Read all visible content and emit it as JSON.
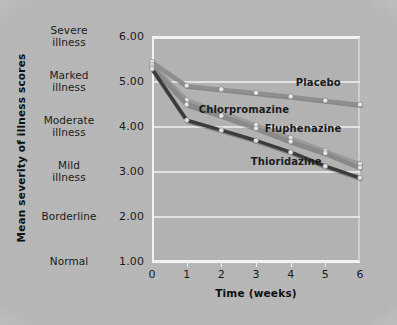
{
  "figure": {
    "background_color": "#b8b8b8",
    "panel_color": "#b2b2b2",
    "grid_color": "#f2f2f2",
    "text_color": "#1b1b1b"
  },
  "axes": {
    "y_title": "Mean severity of illness scores",
    "x_title": "Time (weeks)",
    "y_tick_numbers": [
      "6.00",
      "5.00",
      "4.00",
      "3.00",
      "2.00",
      "1.00"
    ],
    "y_tick_words": [
      [
        "Severe",
        "illness"
      ],
      [
        "Marked",
        "illness"
      ],
      [
        "Moderate",
        "illness"
      ],
      [
        "Mild",
        "illness"
      ],
      [
        "Borderline",
        ""
      ],
      [
        "Normal",
        ""
      ]
    ],
    "x_tick_numbers": [
      "0",
      "1",
      "2",
      "3",
      "4",
      "5",
      "6"
    ]
  },
  "chart_data": {
    "type": "line",
    "title": "",
    "xlabel": "Time (weeks)",
    "ylabel": "Mean severity of illness scores",
    "x": [
      0,
      1,
      2,
      3,
      4,
      5,
      6
    ],
    "xlim": [
      0,
      6
    ],
    "ylim": [
      1.0,
      6.0
    ],
    "y_tick_values": [
      6.0,
      5.0,
      4.0,
      3.0,
      2.0,
      1.0
    ],
    "y_tick_labels": [
      "Severe illness",
      "Marked illness",
      "Moderate illness",
      "Mild illness",
      "Borderline",
      "Normal"
    ],
    "grid": true,
    "grid_axis": "y",
    "legend": "inline-labels",
    "series": [
      {
        "name": "Placebo",
        "color": "#8f8f8f",
        "marker_color": "#e6e6e6",
        "values": [
          5.45,
          4.92,
          4.84,
          4.76,
          4.68,
          4.59,
          4.5
        ],
        "label_x_week": 4.15,
        "label_y_value": 4.97
      },
      {
        "name": "Chlorpromazine",
        "color": "#9a9a9a",
        "marker_color": "#e6e6e6",
        "values": [
          5.38,
          4.6,
          4.33,
          4.05,
          3.76,
          3.47,
          3.18
        ],
        "label_x_week": 1.35,
        "label_y_value": 4.38
      },
      {
        "name": "Fluphenazine",
        "color": "#8a8a8a",
        "marker_color": "#e6e6e6",
        "values": [
          5.33,
          4.5,
          4.25,
          3.97,
          3.68,
          3.42,
          3.1
        ],
        "label_x_week": 3.25,
        "label_y_value": 3.96
      },
      {
        "name": "Thioridazine",
        "color": "#3b3b3b",
        "marker_color": "#e0e0e0",
        "values": [
          5.29,
          4.15,
          3.93,
          3.7,
          3.44,
          3.13,
          2.87
        ],
        "label_x_week": 2.85,
        "label_y_value": 3.22
      }
    ]
  }
}
